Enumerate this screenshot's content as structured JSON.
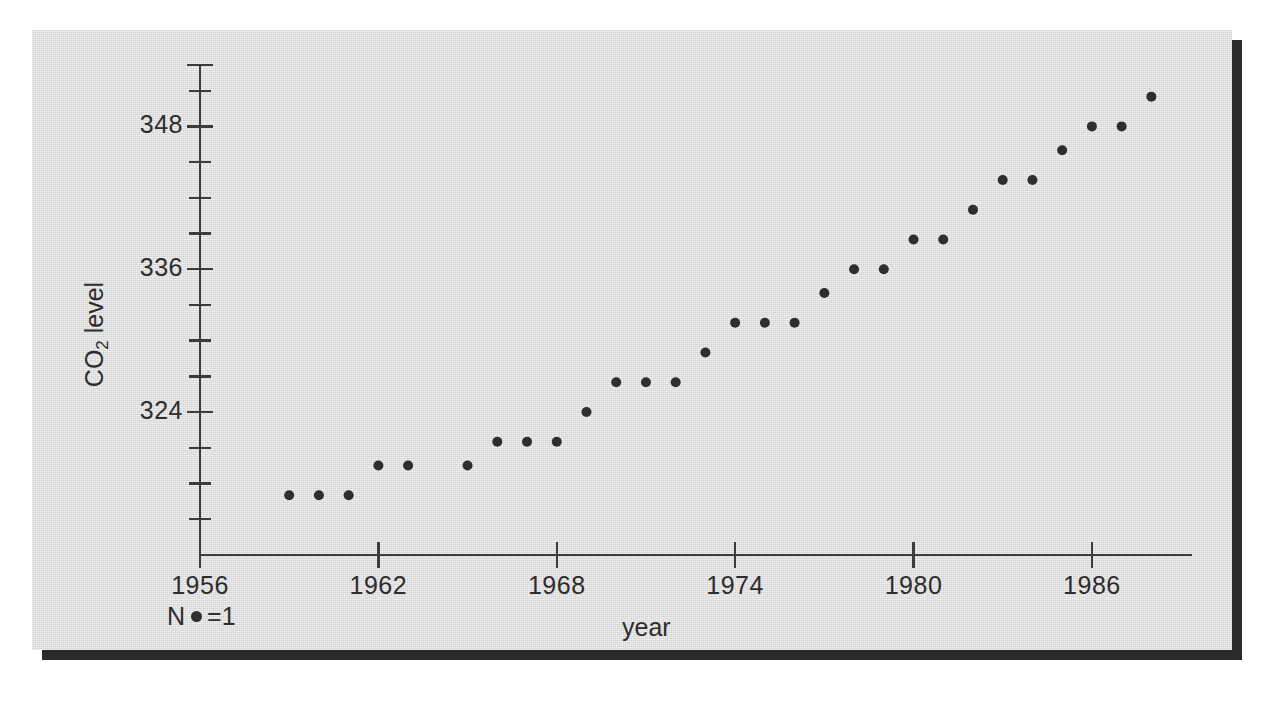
{
  "figure": {
    "background_color": "#dcdcdc",
    "page_background": "#ffffff",
    "shadow_color": "#2b2b2b",
    "ink_color": "#2e2e2e"
  },
  "legend": {
    "n_prefix": "N",
    "n_symbol": "dot-marker",
    "n_equals": "=1",
    "full_text": "N ● =1"
  },
  "chart_data": {
    "type": "scatter",
    "title": "",
    "xlabel": "year",
    "ylabel": "CO2 level",
    "ylabel_display": "CO₂ level",
    "xlim": [
      1953.5,
      1990.5
    ],
    "ylim": [
      313.5,
      352.5
    ],
    "grid": false,
    "legend_position": "below-left",
    "xticks": [
      1956,
      1962,
      1968,
      1974,
      1980,
      1986
    ],
    "xtick_labels": [
      "1956",
      "1962",
      "1968",
      "1974",
      "1980",
      "1986"
    ],
    "xtick_minor_step": 6,
    "yticks": [
      324,
      336,
      348
    ],
    "ytick_labels": [
      "324",
      "336",
      "348"
    ],
    "ytick_minor_step": 3,
    "ytick_minor_values": [
      315,
      318,
      321,
      327,
      330,
      333,
      339,
      342,
      345,
      351
    ],
    "marker": "filled-circle",
    "marker_size": 9,
    "x": [
      1959,
      1960,
      1961,
      1962,
      1963,
      1965,
      1966,
      1967,
      1968,
      1969,
      1970,
      1971,
      1972,
      1973,
      1974,
      1975,
      1976,
      1977,
      1978,
      1979,
      1980,
      1981,
      1982,
      1983,
      1984,
      1985,
      1986,
      1987,
      1988
    ],
    "y": [
      317.0,
      317.0,
      317.0,
      319.5,
      319.5,
      319.5,
      321.5,
      321.5,
      321.5,
      324.0,
      326.5,
      326.5,
      326.5,
      329.0,
      331.5,
      331.5,
      331.5,
      334.0,
      336.0,
      336.0,
      338.5,
      338.5,
      341.0,
      343.5,
      343.5,
      346.0,
      348.0,
      348.0,
      350.5
    ],
    "series_name": "CO2 level",
    "points": [
      {
        "year": 1959,
        "level": 317.0
      },
      {
        "year": 1960,
        "level": 317.0
      },
      {
        "year": 1961,
        "level": 317.0
      },
      {
        "year": 1962,
        "level": 319.5
      },
      {
        "year": 1963,
        "level": 319.5
      },
      {
        "year": 1965,
        "level": 319.5
      },
      {
        "year": 1966,
        "level": 321.5
      },
      {
        "year": 1967,
        "level": 321.5
      },
      {
        "year": 1968,
        "level": 321.5
      },
      {
        "year": 1969,
        "level": 324.0
      },
      {
        "year": 1970,
        "level": 326.5
      },
      {
        "year": 1971,
        "level": 326.5
      },
      {
        "year": 1972,
        "level": 326.5
      },
      {
        "year": 1973,
        "level": 329.0
      },
      {
        "year": 1974,
        "level": 331.5
      },
      {
        "year": 1975,
        "level": 331.5
      },
      {
        "year": 1976,
        "level": 331.5
      },
      {
        "year": 1977,
        "level": 334.0
      },
      {
        "year": 1978,
        "level": 336.0
      },
      {
        "year": 1979,
        "level": 336.0
      },
      {
        "year": 1980,
        "level": 338.5
      },
      {
        "year": 1981,
        "level": 338.5
      },
      {
        "year": 1982,
        "level": 341.0
      },
      {
        "year": 1983,
        "level": 343.5
      },
      {
        "year": 1984,
        "level": 343.5
      },
      {
        "year": 1985,
        "level": 346.0
      },
      {
        "year": 1986,
        "level": 348.0
      },
      {
        "year": 1987,
        "level": 348.0
      },
      {
        "year": 1988,
        "level": 350.5
      }
    ]
  }
}
